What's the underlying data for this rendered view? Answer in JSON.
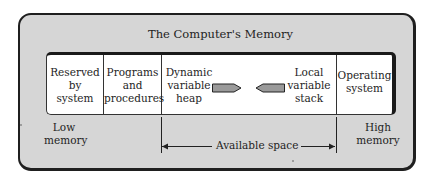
{
  "diagram": {
    "title": "The Computer's Memory",
    "segments": [
      {
        "lines": [
          "Reserved",
          "by",
          "system"
        ]
      },
      {
        "lines": [
          "Programs",
          "and",
          "procedures"
        ]
      },
      {
        "heap_lines": [
          "Dynamic",
          "variable",
          "heap"
        ],
        "stack_lines": [
          "Local",
          "variable",
          "stack"
        ]
      },
      {
        "lines": [
          "Operating",
          "system"
        ]
      }
    ],
    "low_label": [
      "Low",
      "memory"
    ],
    "high_label": [
      "High",
      "memory"
    ],
    "available_label": "Available space",
    "colors": {
      "panel_background": "#d6d6d6",
      "memory_background": "#ffffff",
      "border": "#1f1f1f",
      "growth_arrow_fill": "#9a9a9a"
    }
  }
}
